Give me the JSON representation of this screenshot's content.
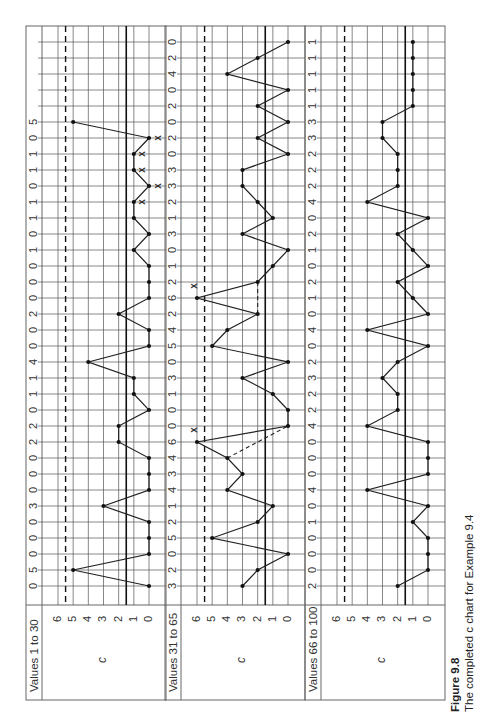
{
  "chart_data": {
    "type": "line",
    "title": "The completed c chart for Example 9.4",
    "figure_label": "Figure 9.8",
    "orientation": "rotated 90 degrees counter-clockwise (values run bottom-to-top)",
    "ylabel": "c",
    "y_ticks": [
      0,
      1,
      2,
      3,
      4,
      5,
      6
    ],
    "ylim": [
      0,
      6
    ],
    "center_line": 1.5,
    "ucl": 5.5,
    "grid": true,
    "panels": [
      {
        "label": "Values 1 to 30",
        "start": 1,
        "values": [
          0,
          5,
          0,
          0,
          0,
          3,
          0,
          0,
          0,
          2,
          2,
          0,
          1,
          1,
          4,
          0,
          0,
          2,
          0,
          0,
          0,
          1,
          0,
          1,
          1,
          0,
          1,
          1,
          0,
          5
        ],
        "x_markers": [
          25,
          26,
          27,
          28,
          29
        ],
        "dashed_links": []
      },
      {
        "label": "Values 31 to 65",
        "start": 31,
        "values": [
          3,
          2,
          0,
          5,
          2,
          1,
          4,
          3,
          4,
          6,
          0,
          0,
          1,
          3,
          0,
          5,
          4,
          2,
          6,
          2,
          1,
          0,
          3,
          1,
          2,
          3,
          3,
          0,
          2,
          0,
          2,
          0,
          4,
          2,
          0
        ],
        "x_markers": [
          40,
          49
        ],
        "dashed_links": [
          [
            39,
            41
          ],
          [
            48,
            50
          ]
        ]
      },
      {
        "label": "Values 66 to 100",
        "start": 66,
        "values": [
          2,
          0,
          0,
          0,
          1,
          0,
          4,
          0,
          0,
          0,
          4,
          2,
          2,
          3,
          2,
          0,
          4,
          0,
          1,
          2,
          0,
          1,
          2,
          0,
          4,
          2,
          2,
          2,
          3,
          3,
          1,
          1,
          1,
          1,
          1
        ],
        "x_markers": [],
        "dashed_links": []
      }
    ]
  },
  "caption": {
    "figure": "Figure 9.8",
    "text": "The completed c chart for Example 9.4"
  },
  "style": {
    "line_color": "#222222",
    "grid_color": "#555555",
    "frame_color": "#666666"
  }
}
